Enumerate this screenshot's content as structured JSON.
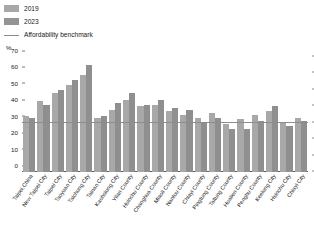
{
  "legend": {
    "items": [
      {
        "label": "2019",
        "type": "swatch",
        "color": "#a8a8a8"
      },
      {
        "label": "2023",
        "type": "swatch",
        "color": "#8f8f8f"
      },
      {
        "label": "Affordability benchmark",
        "type": "line",
        "color": "#8d8d8d"
      }
    ]
  },
  "axis": {
    "unit_label": "%",
    "y_ticks": [
      "0",
      "10",
      "20",
      "30",
      "40",
      "50",
      "60",
      "70"
    ]
  },
  "chart_data": {
    "type": "bar",
    "title": "",
    "subtitle": "",
    "xlabel": "",
    "ylabel": "%",
    "ylim": [
      0,
      70
    ],
    "ytick_step": 10,
    "grid": false,
    "legend_position": "top-left",
    "benchmark": {
      "label": "Affordability benchmark",
      "value": 30,
      "color": "#8d8d8d"
    },
    "categories": [
      "Taipei,China",
      "New Taipei City",
      "Taipei City",
      "Taoyuan City",
      "Taichung City",
      "Tainan City",
      "Kaohsiung City",
      "Yilan County",
      "Hsinchu County",
      "Changhua County",
      "Miaoli County",
      "Nantou County",
      "Chiayi County",
      "Pingtung County",
      "Taitung County",
      "Hualien County",
      "Penghu County",
      "Keelung City",
      "Hsinchu City",
      "Chiayi City"
    ],
    "series": [
      {
        "name": "2019",
        "color": "#a8a8a8",
        "values": [
          34,
          43,
          48,
          53,
          59,
          33,
          38,
          44,
          40,
          41,
          37,
          35,
          33,
          36,
          29,
          32,
          35,
          37,
          30,
          33
        ]
      },
      {
        "name": "2023",
        "color": "#8f8f8f",
        "values": [
          33,
          41,
          50,
          56,
          65,
          34,
          42,
          48,
          41,
          44,
          39,
          38,
          30,
          33,
          26,
          26,
          31,
          40,
          28,
          31
        ]
      }
    ]
  }
}
